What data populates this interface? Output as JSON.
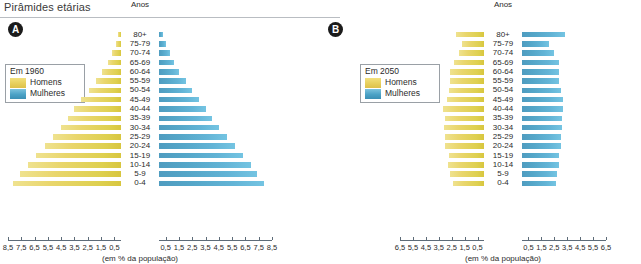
{
  "header": {
    "title": "Pirâmides etárias"
  },
  "panels": [
    {
      "badge": "A",
      "anos_label": "Anos",
      "legend": {
        "title": "Em 1960",
        "men_label": "Homens",
        "women_label": "Mulheres"
      },
      "axis_caption": "(em % da população)",
      "colors": {
        "men": "#e2cf52",
        "women": "#59a9ce"
      }
    },
    {
      "badge": "B",
      "anos_label": "Anos",
      "legend": {
        "title": "Em 2050",
        "men_label": "Homens",
        "women_label": "Mulheres"
      },
      "axis_caption": "(em % da população)",
      "colors": {
        "men": "#e2cf52",
        "women": "#59a9ce"
      }
    }
  ],
  "chart_data": [
    {
      "type": "bar",
      "subtype": "population-pyramid",
      "title": "Pirâmides etárias",
      "panel": "A",
      "legend_title": "Em 1960",
      "xlabel": "(em % da população)",
      "ylabel": "Anos",
      "legend": [
        "Homens",
        "Mulheres"
      ],
      "legend_position": "left",
      "grid": false,
      "xlim": [
        0,
        8.5
      ],
      "xticks": [
        0.5,
        1.5,
        2.5,
        3.5,
        4.5,
        5.5,
        6.5,
        7.5,
        8.5
      ],
      "xticklabels_left": [
        "8,5",
        "7,5",
        "6,5",
        "5,5",
        "4,5",
        "3,5",
        "2,5",
        "1,5",
        "0,5"
      ],
      "xticklabels_right": [
        "0,5",
        "1,5",
        "2,5",
        "3,5",
        "4,5",
        "5,5",
        "6,5",
        "7,5",
        "8,5"
      ],
      "categories": [
        "80+",
        "75-79",
        "70-74",
        "65-69",
        "60-64",
        "55-59",
        "50-54",
        "45-49",
        "40-44",
        "35-39",
        "30-34",
        "25-29",
        "20-24",
        "15-19",
        "10-14",
        "5-9",
        "0-4"
      ],
      "series": [
        {
          "name": "Homens",
          "side": "left",
          "values": [
            0.2,
            0.4,
            0.7,
            1.0,
            1.4,
            1.9,
            2.4,
            3.0,
            3.5,
            4.0,
            4.5,
            5.1,
            5.7,
            6.4,
            7.0,
            7.6,
            8.1
          ]
        },
        {
          "name": "Mulheres",
          "side": "right",
          "values": [
            0.3,
            0.5,
            0.8,
            1.1,
            1.5,
            2.0,
            2.5,
            3.0,
            3.5,
            4.0,
            4.5,
            5.1,
            5.7,
            6.3,
            6.9,
            7.4,
            7.9
          ]
        }
      ]
    },
    {
      "type": "bar",
      "subtype": "population-pyramid",
      "title": "Pirâmides etárias",
      "panel": "B",
      "legend_title": "Em 2050",
      "xlabel": "(em % da população)",
      "ylabel": "Anos",
      "legend": [
        "Homens",
        "Mulheres"
      ],
      "legend_position": "left",
      "grid": false,
      "xlim": [
        0,
        6.5
      ],
      "xticks": [
        0.5,
        1.5,
        2.5,
        3.5,
        4.5,
        5.5,
        6.5
      ],
      "xticklabels_left": [
        "6,5",
        "5,5",
        "4,5",
        "3,5",
        "2,5",
        "1,5",
        "0,5"
      ],
      "xticklabels_right": [
        "0,5",
        "1,5",
        "2,5",
        "3,5",
        "4,5",
        "5,5",
        "6,5"
      ],
      "categories": [
        "80+",
        "75-79",
        "70-74",
        "65-69",
        "60-64",
        "55-59",
        "50-54",
        "45-49",
        "40-44",
        "35-39",
        "30-34",
        "25-29",
        "20-24",
        "15-19",
        "10-14",
        "5-9",
        "0-4"
      ],
      "series": [
        {
          "name": "Homens",
          "side": "left",
          "values": [
            2.2,
            1.7,
            1.9,
            2.3,
            2.6,
            2.6,
            2.7,
            2.9,
            3.2,
            3.0,
            3.1,
            3.0,
            3.0,
            2.7,
            2.8,
            2.6,
            2.4
          ]
        },
        {
          "name": "Mulheres",
          "side": "right",
          "values": [
            3.3,
            2.1,
            2.5,
            2.9,
            2.9,
            2.9,
            3.0,
            3.2,
            3.2,
            3.1,
            3.1,
            3.0,
            3.0,
            2.9,
            2.9,
            2.7,
            2.6
          ]
        }
      ]
    }
  ]
}
